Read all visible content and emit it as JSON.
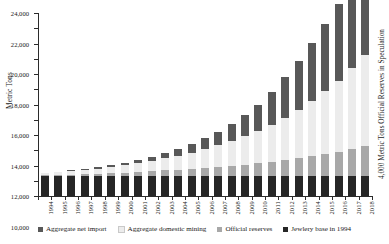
{
  "chart_data": {
    "type": "bar",
    "stacked": true,
    "title": "",
    "xlabel": "",
    "ylabel": "Metric Tons",
    "right_axis_label": "4,000 Metric Tons Official Reserves in Speculation",
    "ylim": [
      0,
      24000
    ],
    "ytick_step": 2000,
    "ytick_labels": [
      "0",
      "2,000",
      "4,000",
      "6,000",
      "8,000",
      "10,000",
      "12,000",
      "14,000",
      "16,000",
      "18,000",
      "20,000",
      "22,000",
      "24,000"
    ],
    "ytick_values": [
      0,
      2000,
      4000,
      6000,
      8000,
      10000,
      12000,
      14000,
      16000,
      18000,
      20000,
      22000,
      24000
    ],
    "grid": false,
    "legend_position": "bottom",
    "categories": [
      "1994",
      "1995",
      "1996",
      "1997",
      "1998",
      "1999",
      "2000",
      "2001",
      "2002",
      "2003",
      "2004",
      "2005",
      "2006",
      "2007",
      "2008",
      "2009",
      "2010",
      "2011",
      "2012",
      "2013",
      "2014",
      "2015",
      "2016",
      "2017",
      "2018"
    ],
    "series": [
      {
        "name": "Jewlery base in 1994",
        "color": "#262626",
        "values": [
          2600,
          2600,
          2600,
          2600,
          2600,
          2600,
          2600,
          2600,
          2600,
          2600,
          2600,
          2600,
          2600,
          2600,
          2600,
          2600,
          2600,
          2600,
          2600,
          2600,
          2600,
          2600,
          2600,
          2600,
          2600
        ]
      },
      {
        "name": "Official reserves",
        "color": "#a8a8a8",
        "values": [
          120,
          160,
          210,
          260,
          330,
          400,
          480,
          570,
          660,
          760,
          870,
          980,
          1100,
          1230,
          1370,
          1520,
          1690,
          1880,
          2090,
          2330,
          2600,
          2900,
          3230,
          3600,
          4000
        ]
      },
      {
        "name": "Aggregate domestic mining",
        "color": "#ececec",
        "values": [
          240,
          330,
          430,
          540,
          660,
          800,
          960,
          1140,
          1340,
          1570,
          1830,
          2120,
          2450,
          2820,
          3240,
          3720,
          4260,
          4870,
          5560,
          6340,
          7220,
          8210,
          9320,
          10560,
          11900
        ]
      },
      {
        "name": "Aggregate net import",
        "color": "#585858",
        "values": [
          60,
          90,
          120,
          160,
          210,
          270,
          350,
          450,
          570,
          720,
          900,
          1120,
          1400,
          1750,
          2190,
          2740,
          3420,
          4280,
          5350,
          6500,
          7700,
          8900,
          10100,
          11300,
          12400
        ]
      }
    ],
    "legend": [
      {
        "label": "Aggregate net import",
        "color": "#585858"
      },
      {
        "label": "Aggregate domestic mining",
        "color": "#ececec"
      },
      {
        "label": "Official reserves",
        "color": "#a8a8a8"
      },
      {
        "label": "Jewlery base in 1994",
        "color": "#262626"
      }
    ]
  }
}
